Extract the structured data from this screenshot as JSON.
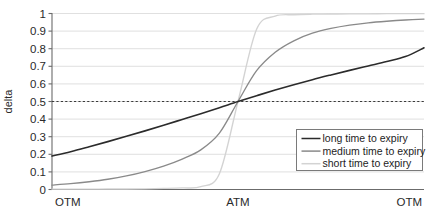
{
  "chart_data": {
    "type": "line",
    "title": "",
    "xlabel": "",
    "ylabel": "delta",
    "ylim": [
      0,
      1
    ],
    "xlim": [
      0,
      1
    ],
    "grid": true,
    "y_ticks": [
      "0",
      "0.1",
      "0.2",
      "0.3",
      "0.4",
      "0.5",
      "0.6",
      "0.7",
      "0.8",
      "0.9",
      "1"
    ],
    "y_tick_values": [
      0,
      0.1,
      0.2,
      0.3,
      0.4,
      0.5,
      0.6,
      0.7,
      0.8,
      0.9,
      1
    ],
    "x_tick_labels": [
      "OTM",
      "ATM",
      "OTM"
    ],
    "x_tick_positions": [
      0,
      0.5,
      1
    ],
    "reference_line": {
      "axis": "y",
      "value": 0.5,
      "style": "dashed",
      "color": "#3a3a3a"
    },
    "legend_position": "lower-right",
    "x": [
      0,
      0.05,
      0.1,
      0.15,
      0.2,
      0.25,
      0.3,
      0.35,
      0.4,
      0.45,
      0.5,
      0.55,
      0.6,
      0.65,
      0.7,
      0.75,
      0.8,
      0.85,
      0.9,
      0.95,
      1
    ],
    "series": [
      {
        "name": "long time to expiry",
        "color": "#2b2b2b",
        "width": 1.6,
        "values": [
          0.19,
          0.215,
          0.243,
          0.272,
          0.302,
          0.333,
          0.365,
          0.398,
          0.431,
          0.465,
          0.5,
          0.533,
          0.565,
          0.595,
          0.624,
          0.651,
          0.677,
          0.702,
          0.727,
          0.755,
          0.805
        ]
      },
      {
        "name": "medium time to expiry",
        "color": "#8a8a8a",
        "width": 1.35,
        "values": [
          0.025,
          0.033,
          0.044,
          0.058,
          0.077,
          0.102,
          0.133,
          0.173,
          0.225,
          0.32,
          0.5,
          0.675,
          0.78,
          0.845,
          0.888,
          0.915,
          0.934,
          0.947,
          0.956,
          0.963,
          0.968
        ]
      },
      {
        "name": "short time to expiry",
        "color": "#d3d3d3",
        "width": 1.35,
        "values": [
          0.002,
          0.002,
          0.002,
          0.003,
          0.003,
          0.004,
          0.006,
          0.009,
          0.016,
          0.09,
          0.5,
          0.91,
          0.985,
          0.993,
          0.996,
          0.997,
          0.998,
          0.998,
          0.999,
          0.999,
          0.999
        ]
      }
    ]
  },
  "legend": {
    "entries": [
      {
        "label": "long time to expiry",
        "color": "#2b2b2b",
        "swatch": "line-swatch"
      },
      {
        "label": "medium time to expiry",
        "color": "#8a8a8a",
        "swatch": "line-swatch"
      },
      {
        "label": "short time to expiry",
        "color": "#d3d3d3",
        "swatch": "line-swatch"
      }
    ]
  }
}
